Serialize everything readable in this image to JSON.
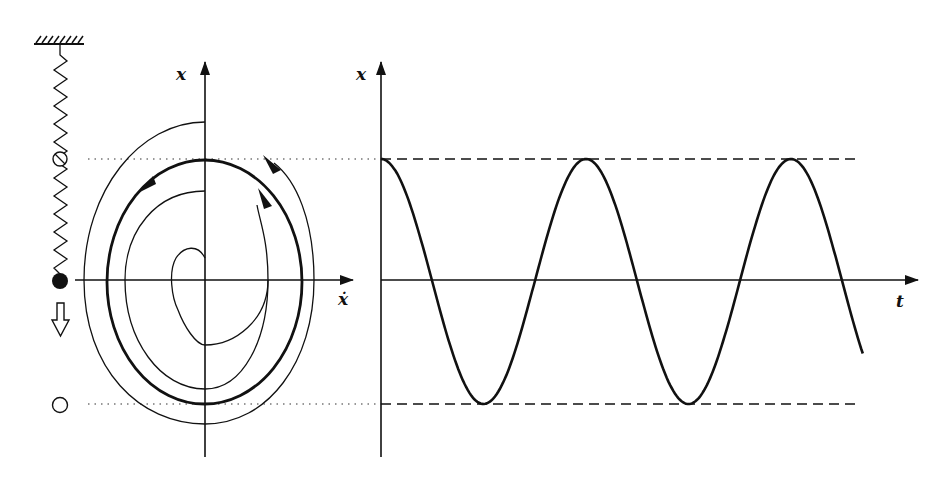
{
  "figure": {
    "spring_panel": {
      "elements": [
        "ceiling-hatch",
        "spring",
        "mass-upper-position-crossed-circle",
        "mass-equilibrium-filled-circle",
        "downward-hollow-arrow",
        "mass-lower-position-open-circle"
      ]
    },
    "phase_portrait": {
      "vertical_axis_label": "x",
      "horizontal_axis_label": "ẋ",
      "curves": [
        "outer spiral (converging inward)",
        "limit cycle (thick)",
        "inner spiral (diverging outward)"
      ],
      "arrow_direction": "counterclockwise"
    },
    "time_plot": {
      "vertical_axis_label": "x",
      "horizontal_axis_label": "t",
      "amplitude_bounds": [
        "upper dashed line = limit cycle max",
        "lower dashed line = limit cycle min"
      ],
      "peaks": 3,
      "troughs": 2
    }
  },
  "chart_data": {
    "type": "line",
    "title": "",
    "xlabel": "t",
    "ylabel": "x",
    "series": [
      {
        "name": "x(t) steady oscillation",
        "shape": "cosine",
        "amplitude": 1,
        "periods_shown": 2.35,
        "x": [
          0,
          0.5,
          1.0,
          1.5,
          2.0,
          2.35
        ],
        "values": [
          1,
          -1,
          1,
          -1,
          1,
          -0.78
        ]
      }
    ],
    "reference_lines": [
      1,
      -1
    ],
    "ylim": [
      -1.45,
      1.8
    ]
  }
}
